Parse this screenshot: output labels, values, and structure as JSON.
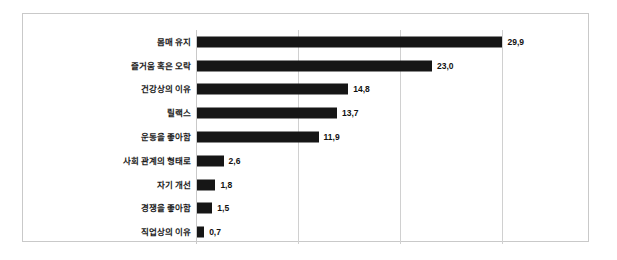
{
  "chart_data": {
    "type": "bar",
    "orientation": "horizontal",
    "title": "",
    "subtitle": "",
    "xlabel": "",
    "ylabel": "",
    "categories": [
      "몸매 유지",
      "즐거움 혹은 오락",
      "건강상의 이유",
      "릴랙스",
      "운동을 좋아함",
      "사회 관계의 형태로",
      "자기 개선",
      "경쟁을 좋아함",
      "직업상의 이유"
    ],
    "values": [
      29.9,
      23.0,
      14.8,
      13.7,
      11.9,
      2.6,
      1.8,
      1.5,
      0.7
    ],
    "value_labels": [
      "29,9",
      "23,0",
      "14,8",
      "13,7",
      "11,9",
      "2,6",
      "1,8",
      "1,5",
      "0,7"
    ],
    "xlim": [
      0,
      32.5
    ],
    "gridline_values": [
      0,
      10,
      20,
      30
    ],
    "grid": true,
    "tick_labels_shown": false,
    "legend": null,
    "bar_color": "#161616",
    "grid_color": "#d0d0d0",
    "frame_color": "#c9c9c9",
    "background_color": "#ffffff",
    "label_color": "#1a1a1a"
  }
}
